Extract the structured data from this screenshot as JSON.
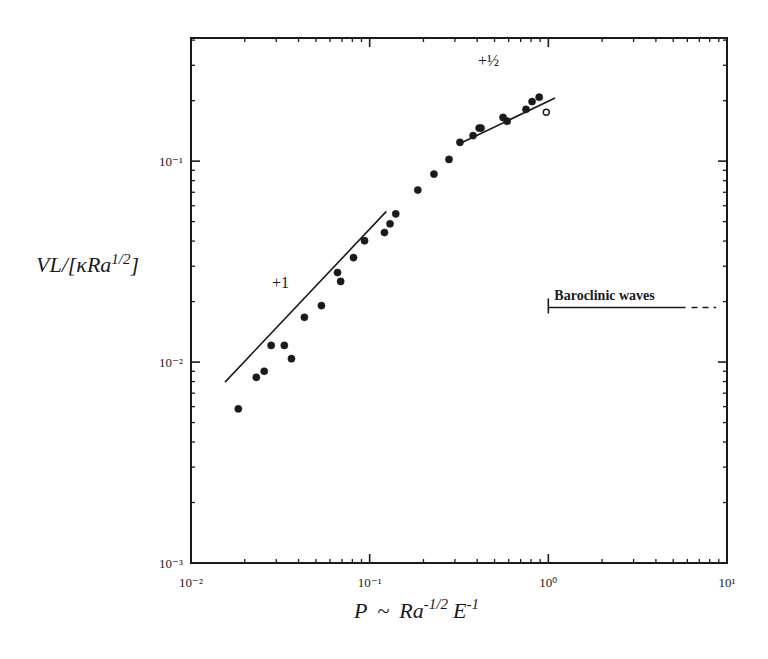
{
  "chart_data": {
    "type": "scatter",
    "title": "",
    "xlabel": "P ~ Ra^{-1/2} E^{-1}",
    "ylabel": "VL/[κRa^{1/2}]",
    "xscale": "log",
    "yscale": "log",
    "xlim": [
      0.01,
      10
    ],
    "ylim": [
      0.001,
      0.41
    ],
    "grid": false,
    "legend": null,
    "x_ticks": [
      {
        "value": 0.01,
        "label": "10⁻²"
      },
      {
        "value": 0.1,
        "label": "10⁻¹"
      },
      {
        "value": 1,
        "label": "10⁰"
      },
      {
        "value": 10,
        "label": "10¹"
      }
    ],
    "y_ticks": [
      {
        "value": 0.001,
        "label": "10⁻³"
      },
      {
        "value": 0.01,
        "label": "10⁻²"
      },
      {
        "value": 0.1,
        "label": "10⁻¹"
      }
    ],
    "series": [
      {
        "name": "filled",
        "marker": "filled-circle",
        "x": [
          0.0184,
          0.0232,
          0.0257,
          0.0281,
          0.0333,
          0.0365,
          0.0431,
          0.0537,
          0.0661,
          0.0688,
          0.0812,
          0.0936,
          0.121,
          0.13,
          0.14,
          0.186,
          0.229,
          0.278,
          0.32,
          0.379,
          0.41,
          0.42,
          0.558,
          0.588,
          0.75,
          0.811,
          0.889
        ],
        "y": [
          0.00585,
          0.0084,
          0.009,
          0.0121,
          0.0121,
          0.0104,
          0.0167,
          0.0191,
          0.0279,
          0.0252,
          0.0331,
          0.0402,
          0.0441,
          0.0488,
          0.0547,
          0.0718,
          0.0862,
          0.102,
          0.124,
          0.134,
          0.146,
          0.146,
          0.165,
          0.158,
          0.181,
          0.198,
          0.208
        ]
      },
      {
        "name": "open",
        "marker": "open-circle",
        "x": [
          0.974
        ],
        "y": [
          0.175
        ]
      }
    ],
    "annotations": [
      {
        "type": "slope-line",
        "label": "+1",
        "x": [
          0.0155,
          0.124
        ],
        "y": [
          0.00795,
          0.0562
        ]
      },
      {
        "type": "slope-line",
        "label": "+½",
        "x": [
          0.32,
          1.09
        ],
        "y": [
          0.1225,
          0.206
        ]
      },
      {
        "type": "regime-bar",
        "label": "Baroclinic waves",
        "x_start": 1.0,
        "x_solid_end": 5.86,
        "x_dashed_end": 8.7,
        "y": 0.0187
      }
    ]
  },
  "axes": {
    "x_title_main": "P",
    "x_title_tilde": "~",
    "x_title_ra": "Ra",
    "x_title_ra_exp": "-1/2",
    "x_title_e": "E",
    "x_title_e_exp": "-1",
    "y_title_main": "VL/[κRa",
    "y_title_exp": "1/2",
    "y_title_close": "]"
  }
}
